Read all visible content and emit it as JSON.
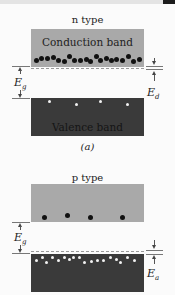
{
  "figure": {
    "panel_a": {
      "title": "n type",
      "upper_band_label": "Conduction band",
      "lower_band_label": "Valence band",
      "gap_label": "E",
      "gap_sub": "g",
      "level_label": "E",
      "level_sub": "d",
      "caption": "(a)",
      "carriers_in_conduction": "electrons (dark dots)",
      "carriers_in_valence": "holes (white dots)"
    },
    "panel_b": {
      "title": "p type",
      "upper_band_label": "",
      "gap_label": "E",
      "gap_sub": "g",
      "level_label": "E",
      "level_sub": "a",
      "carriers_in_conduction": "electrons (dark dots)",
      "carriers_in_valence": "holes (white dots)"
    },
    "colors": {
      "conduction_band": "#a9a9a9",
      "valence_band": "#3a3a3a",
      "electron": "#111111",
      "hole": "#f2f2f2"
    }
  }
}
